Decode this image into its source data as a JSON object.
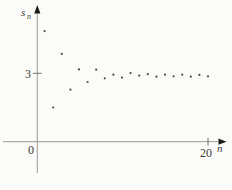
{
  "figure": {
    "background_color": "#fbfbf9",
    "axis_color": "#9b9b98",
    "arrow_color": "#1c1c1a",
    "point_color": "#4c4c4a",
    "label_color": "#3a3a38"
  },
  "labels": {
    "y_axis_base": "s",
    "y_axis_sub": "n",
    "x_axis": "n",
    "origin": "0",
    "y_tick": "3",
    "x_tick": "20"
  },
  "chart_data": {
    "type": "scatter",
    "title": "",
    "xlabel": "n",
    "ylabel": "s_n",
    "xlim": [
      0,
      22.5
    ],
    "ylim": [
      0,
      5.9
    ],
    "x_ticks": [
      {
        "value": 20,
        "label": "20"
      }
    ],
    "y_ticks": [
      {
        "value": 3,
        "label": "3"
      }
    ],
    "grid": false,
    "legend": false,
    "x": [
      1,
      2,
      3,
      4,
      5,
      6,
      7,
      8,
      9,
      10,
      11,
      12,
      13,
      14,
      15,
      16,
      17,
      18,
      19,
      20
    ],
    "y": [
      4.85,
      1.5,
      3.85,
      2.28,
      3.17,
      2.62,
      3.16,
      2.78,
      2.94,
      2.81,
      3.01,
      2.9,
      2.96,
      2.85,
      2.94,
      2.87,
      2.94,
      2.85,
      2.93,
      2.87
    ],
    "converges_to": 3
  }
}
